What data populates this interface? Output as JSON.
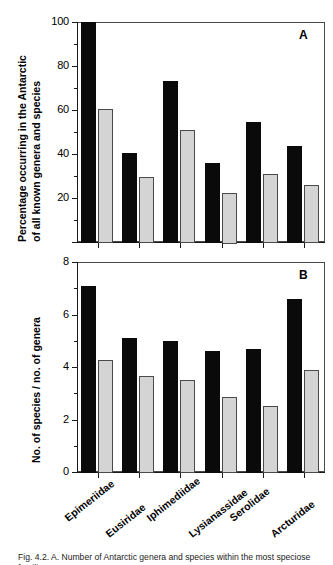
{
  "figure": {
    "caption": "Fig. 4.2. A. Number of Antarctic genera and species within the most speciose families"
  },
  "chart_data": [
    {
      "type": "bar",
      "panel": "A",
      "panel_letter": "A",
      "title": "",
      "xlabel": "",
      "ylabel": "Percentage occurring in the Antarctic of all known genera and species",
      "ylabel_lines": [
        "Percentage occurring in the Antarctic",
        "of all known genera and species"
      ],
      "ylim": [
        0,
        100
      ],
      "yticks": [
        0,
        20,
        40,
        60,
        80,
        100
      ],
      "ytick_labels": [
        "",
        "20",
        "40",
        "60",
        "80",
        "100"
      ],
      "minor_ticks": true,
      "grid": false,
      "legend": "none",
      "categories": [
        "Epimeriidae",
        "Eusiridae",
        "Iphimediidae",
        "Lysianassidae",
        "Serolidae",
        "Arcturidae"
      ],
      "series": [
        {
          "name": "genera",
          "color": "#0a0a0a",
          "values": [
            100,
            40.5,
            73,
            36,
            54.5,
            43.5
          ]
        },
        {
          "name": "species",
          "color": "#d4d4d4",
          "values": [
            60.5,
            29.5,
            51,
            22.5,
            31,
            26
          ]
        }
      ]
    },
    {
      "type": "bar",
      "panel": "B",
      "panel_letter": "B",
      "title": "",
      "xlabel": "",
      "ylabel": "No. of species /  no. of genera",
      "ylabel_lines": [
        "No. of species /  no. of genera"
      ],
      "ylim": [
        0,
        8
      ],
      "yticks": [
        0,
        2,
        4,
        6,
        8
      ],
      "ytick_labels": [
        "0",
        "2",
        "4",
        "6",
        "8"
      ],
      "minor_ticks": true,
      "grid": false,
      "legend": "none",
      "categories": [
        "Epimeriidae",
        "Eusiridae",
        "Iphimediidae",
        "Lysianassidae",
        "Serolidae",
        "Arcturidae"
      ],
      "series": [
        {
          "name": "genera",
          "color": "#0a0a0a",
          "values": [
            7.1,
            5.1,
            5.0,
            4.6,
            4.7,
            6.6
          ]
        },
        {
          "name": "species",
          "color": "#d4d4d4",
          "values": [
            4.25,
            3.65,
            3.5,
            2.85,
            2.5,
            3.9
          ]
        }
      ]
    }
  ]
}
